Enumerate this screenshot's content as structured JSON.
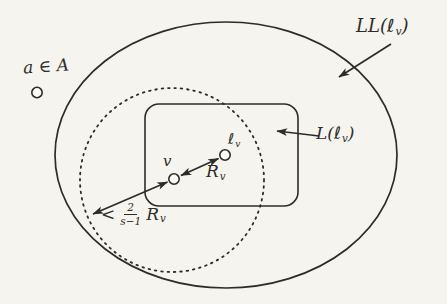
{
  "figure": {
    "colors": {
      "background": "#f5f4ef",
      "ink": "#2e2c28"
    },
    "points": {
      "a": {
        "label": "a ∈ A"
      },
      "v": {
        "label": "v"
      },
      "lv": {
        "label_main": "ℓ",
        "label_sub": "v"
      }
    },
    "sets": {
      "outer": {
        "prefix": "LL(ℓ",
        "sub": "v",
        "suffix": ")"
      },
      "inner": {
        "prefix": "L(ℓ",
        "sub": "v",
        "suffix": ")"
      }
    },
    "measures": {
      "radius": {
        "main": "R",
        "sub": "v"
      },
      "bound": {
        "relation": "<",
        "numerator": "2",
        "denominator": "s−1",
        "main": "R",
        "sub": "v"
      }
    }
  }
}
